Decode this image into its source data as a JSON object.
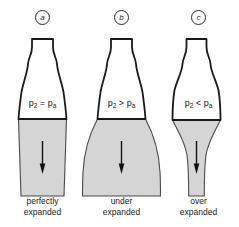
{
  "figure": {
    "colors": {
      "background": "#ffffff",
      "outline": "#1a1a1a",
      "plume_fill": "#d5d5d5",
      "plume_edge": "#4a4a4a",
      "arrow": "#111111"
    }
  },
  "panels": [
    {
      "id": "a",
      "badge": "a",
      "pressure_left": "p",
      "pressure_left_sub": "2",
      "operator": "=",
      "pressure_right": "p",
      "pressure_right_sub": "a",
      "pressure_relation": "p2 = pa",
      "caption_line1": "perfectly",
      "caption_line2": "expanded",
      "plume_shape": "parallel-column",
      "arrow_name": "flow-direction-arrow-a"
    },
    {
      "id": "b",
      "badge": "b",
      "pressure_left": "p",
      "pressure_left_sub": "2",
      "operator": ">",
      "pressure_right": "p",
      "pressure_right_sub": "a",
      "pressure_relation": "p2 > pa",
      "caption_line1": "under",
      "caption_line2": "expanded",
      "plume_shape": "outward-expanding-bell",
      "arrow_name": "flow-direction-arrow-b"
    },
    {
      "id": "c",
      "badge": "c",
      "pressure_left": "p",
      "pressure_left_sub": "2",
      "operator": "<",
      "pressure_right": "p",
      "pressure_right_sub": "a",
      "pressure_relation": "p2 < pa",
      "caption_line1": "over",
      "caption_line2": "expanded",
      "plume_shape": "inward-contracting-column",
      "arrow_name": "flow-direction-arrow-c"
    }
  ]
}
